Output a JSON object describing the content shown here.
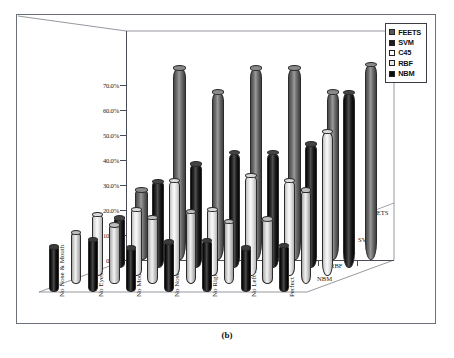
{
  "figure": {
    "caption": "(b)"
  },
  "legend": {
    "items": [
      {
        "label": "FEETS",
        "color": "#585858",
        "filled": true
      },
      {
        "label": "SVM",
        "color": "#1d1d1d",
        "filled": true
      },
      {
        "label": "C45",
        "color": "#ffffff",
        "filled": false
      },
      {
        "label": "RBF",
        "color": "#d2d2d2",
        "filled": false
      },
      {
        "label": "NBM",
        "color": "#0d0d0d",
        "filled": true
      }
    ]
  },
  "axes": {
    "y_ticks": [
      "0.0%",
      "10.0%",
      "20.0%",
      "30.0%",
      "40.0%",
      "50.0%",
      "60.0%",
      "70.0%"
    ],
    "y_values": [
      0,
      10,
      20,
      30,
      40,
      50,
      60,
      70
    ],
    "x_categories": [
      "No Nose & Mouth",
      "No Eyes",
      "No Mouth",
      "No Nose",
      "No Right Eye",
      "No Left Eye",
      "Perfect"
    ],
    "z_categories": [
      "NBM",
      "RBF",
      "C45",
      "SVM",
      "FEETS"
    ]
  },
  "chart_data": {
    "type": "bar",
    "title": "",
    "subtitle": "",
    "xlabel": "",
    "ylabel": "",
    "ylim": [
      0,
      80
    ],
    "grid": false,
    "legend_position": "top-right",
    "projection": "3d-cylinder",
    "categories": [
      "No Nose & Mouth",
      "No Eyes",
      "No Mouth",
      "No Nose",
      "No Right Eye",
      "No Left Eye",
      "Perfect"
    ],
    "depth_order_front_to_back": [
      "NBM",
      "RBF",
      "C45",
      "SVM",
      "FEETS"
    ],
    "series": [
      {
        "name": "NBM",
        "color": "#0d0d0d",
        "values": [
          18.0,
          21.0,
          17.5,
          20.0,
          20.5,
          17.5,
          18.5
        ]
      },
      {
        "name": "RBF",
        "color": "#d2d2d2",
        "values": [
          20.5,
          23.5,
          26.5,
          29.0,
          25.0,
          26.0,
          37.5
        ]
      },
      {
        "name": "C45",
        "color": "#efefef",
        "values": [
          24.5,
          26.5,
          38.0,
          26.5,
          40.0,
          38.0,
          57.5
        ]
      },
      {
        "name": "SVM",
        "color": "#1d1d1d",
        "values": [
          20.0,
          34.5,
          41.5,
          46.0,
          46.0,
          49.5,
          70.0
        ]
      },
      {
        "name": "FEETS",
        "color": "#6b6b6b",
        "values": [
          28.0,
          76.5,
          67.0,
          76.5,
          76.5,
          67.0,
          78.0
        ]
      }
    ]
  }
}
